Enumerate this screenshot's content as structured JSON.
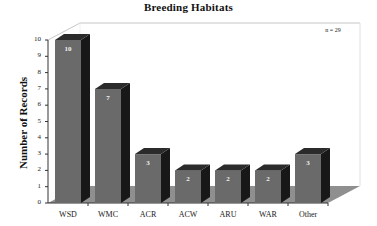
{
  "chart_data": {
    "type": "bar",
    "title": "Breeding Habitats",
    "xlabel": "",
    "ylabel": "Number of Records",
    "categories": [
      "WSD",
      "WMC",
      "ACR",
      "ACW",
      "ARU",
      "WAR",
      "Other"
    ],
    "values": [
      10,
      7,
      3,
      2,
      2,
      2,
      3
    ],
    "ylim": [
      0,
      10
    ],
    "ytick_labels": [
      "10",
      "9",
      "8",
      "7",
      "6",
      "5",
      "4",
      "3",
      "2",
      "1",
      "0"
    ],
    "ytick_values": [
      10,
      9,
      8,
      7,
      6,
      5,
      4,
      3,
      2,
      1,
      0
    ],
    "annotation": "n = 29",
    "grid": false,
    "legend": "none",
    "style": "3d-column",
    "colors": {
      "bar_front": "#6a6a6a",
      "bar_side": "#181818",
      "bar_top": "#2b2b2b",
      "floor": "#8f8f8f",
      "background": "#ffffff",
      "axis": "#333333",
      "value_label": "#f2f2f2"
    }
  }
}
